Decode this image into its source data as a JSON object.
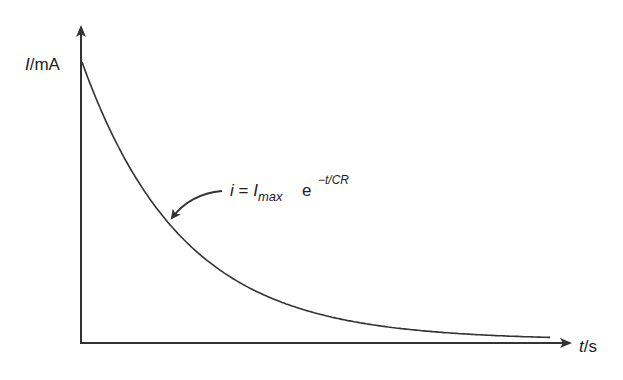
{
  "chart_data": {
    "type": "line",
    "title": "",
    "xlabel": "t/s",
    "ylabel": "I/mA",
    "xlabel_parts": {
      "var": "t",
      "unit": "/s"
    },
    "ylabel_parts": {
      "var": "I",
      "unit": "/mA"
    },
    "grid": false,
    "legend": "none",
    "ticks": {
      "x": [],
      "y": []
    },
    "series": [
      {
        "name": "capacitor discharge current",
        "function": "i = I_max * exp(-t/CR)",
        "description": "exponential decay from I_max toward zero",
        "x_norm": [
          0.0,
          0.1,
          0.2,
          0.3,
          0.4,
          0.5,
          0.6,
          0.7,
          0.8,
          1.0
        ],
        "y_norm": [
          1.0,
          0.62,
          0.39,
          0.24,
          0.15,
          0.09,
          0.06,
          0.035,
          0.02,
          0.01
        ]
      }
    ],
    "annotations": [
      {
        "text": "i = I_max e^(−t/CR)",
        "parts": {
          "lhs": "i",
          "eq": " = ",
          "I": "I",
          "sub": "max",
          "e": "e",
          "sup": "−t/CR"
        },
        "arrow_to": "curve"
      }
    ],
    "colors": {
      "line": "#333333",
      "axis": "#333333",
      "text": "#222222",
      "background": "#ffffff"
    }
  },
  "geometry": {
    "origin": [
      81,
      343
    ],
    "y_axis_top": 25,
    "x_axis_end": 572,
    "curve_start_y": 62,
    "curve_end_x": 550,
    "asymptote_y": 340,
    "tau_px": 100
  }
}
